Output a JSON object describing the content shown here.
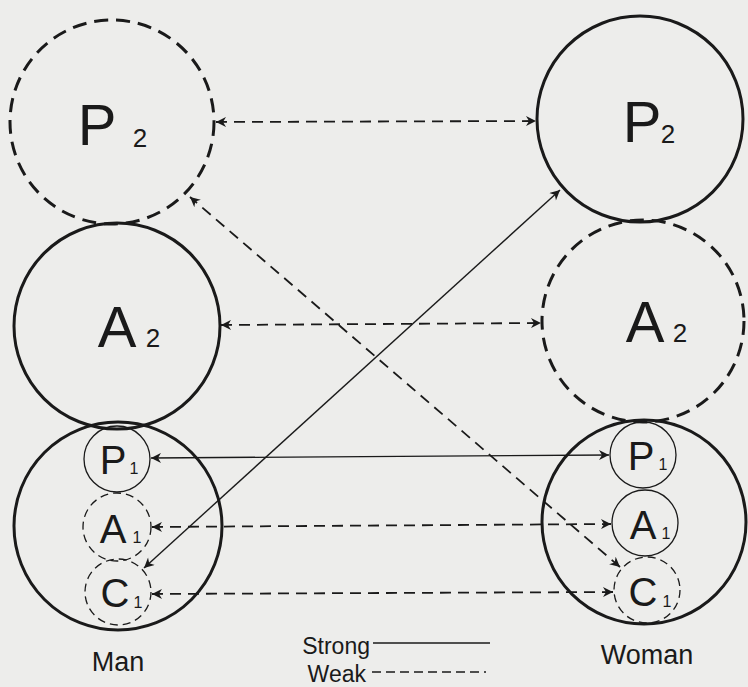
{
  "diagram": {
    "colors": {
      "background": "#ededeb",
      "ink": "#1a1a1a"
    },
    "people": [
      {
        "label": "Man",
        "outer_circles": [
          {
            "letter": "P",
            "sub": "2",
            "style": "weak"
          },
          {
            "letter": "A",
            "sub": "2",
            "style": "strong"
          },
          {
            "letter": "C",
            "sub": "",
            "style": "strong",
            "container": true
          }
        ],
        "inner_circles": [
          {
            "letter": "P",
            "sub": "1",
            "style": "strong"
          },
          {
            "letter": "A",
            "sub": "1",
            "style": "weak"
          },
          {
            "letter": "C",
            "sub": "1",
            "style": "weak"
          }
        ]
      },
      {
        "label": "Woman",
        "outer_circles": [
          {
            "letter": "P",
            "sub": "2",
            "style": "strong"
          },
          {
            "letter": "A",
            "sub": "2",
            "style": "weak"
          },
          {
            "letter": "C",
            "sub": "",
            "style": "strong",
            "container": true
          }
        ],
        "inner_circles": [
          {
            "letter": "P",
            "sub": "1",
            "style": "strong"
          },
          {
            "letter": "A",
            "sub": "1",
            "style": "strong"
          },
          {
            "letter": "C",
            "sub": "1",
            "style": "weak"
          }
        ]
      }
    ],
    "connections": [
      {
        "from": "Man P2",
        "to": "Woman P2",
        "style": "weak",
        "bidirectional": true
      },
      {
        "from": "Man A2",
        "to": "Woman A2",
        "style": "weak",
        "bidirectional": true
      },
      {
        "from": "Man P1",
        "to": "Woman P1",
        "style": "strong",
        "bidirectional": true
      },
      {
        "from": "Man A1",
        "to": "Woman A1",
        "style": "weak",
        "bidirectional": true
      },
      {
        "from": "Man C1",
        "to": "Woman C1",
        "style": "weak",
        "bidirectional": true
      },
      {
        "from": "Man C1",
        "to": "Woman P2",
        "style": "strong",
        "bidirectional": true
      },
      {
        "from": "Woman C1",
        "to": "Man P2",
        "style": "weak",
        "bidirectional": true
      }
    ],
    "labels": {
      "man_p2_letter": "P",
      "man_p2_sub": "2",
      "man_a2_letter": "A",
      "man_a2_sub": "2",
      "man_p1_letter": "P",
      "man_p1_sub": "1",
      "man_a1_letter": "A",
      "man_a1_sub": "1",
      "man_c1_letter": "C",
      "man_c1_sub": "1",
      "woman_p2_letter": "P",
      "woman_p2_sub": "2",
      "woman_a2_letter": "A",
      "woman_a2_sub": "2",
      "woman_p1_letter": "P",
      "woman_p1_sub": "1",
      "woman_a1_letter": "A",
      "woman_a1_sub": "1",
      "woman_c1_letter": "C",
      "woman_c1_sub": "1",
      "man": "Man",
      "woman": "Woman"
    },
    "legend": {
      "strong_label": "Strong",
      "weak_label": "Weak"
    }
  }
}
